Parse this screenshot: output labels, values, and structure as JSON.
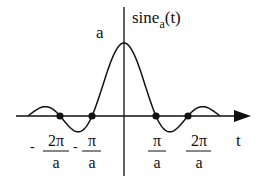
{
  "chart_data": {
    "type": "line",
    "function": "a*sin(a*t)/(a*t)",
    "ylabel": {
      "main": "sine",
      "subscript": "a",
      "suffix": "(t)"
    },
    "xlabel": "t",
    "peak_label": "a",
    "x_range_in_pi_over_a": [
      -3,
      3
    ],
    "zero_crossings_marked": [
      -2,
      -1,
      1,
      2
    ],
    "tick_labels": [
      {
        "sign": "-",
        "numerator": "2π",
        "denominator": "a",
        "value_pi_over_a": -2
      },
      {
        "sign": "-",
        "numerator": "π",
        "denominator": "a",
        "value_pi_over_a": -1
      },
      {
        "sign": "",
        "numerator": "π",
        "denominator": "a",
        "value_pi_over_a": 1
      },
      {
        "sign": "",
        "numerator": "2π",
        "denominator": "a",
        "value_pi_over_a": 2
      }
    ],
    "grid": false,
    "legend": "none"
  },
  "layout": {
    "origin_x": 124,
    "axis_y": 116,
    "px_per_pi_over_a": 32,
    "amplitude_px": 73,
    "color": "#111111"
  }
}
